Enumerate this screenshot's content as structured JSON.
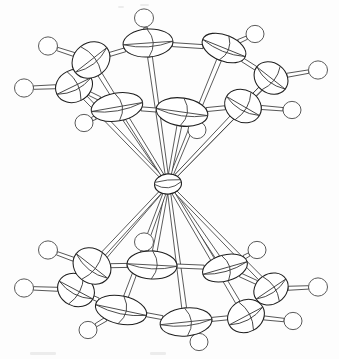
{
  "figure": {
    "kind": "ortep-thermal-ellipsoid-plot",
    "title": "",
    "caption": "",
    "background_color": "#fdfdfd",
    "line_color": "#1f1f1f",
    "hydrogen_line_color": "#5a5a5a",
    "width": 339,
    "height": 359
  },
  "structure": {
    "metal": {
      "label": "M",
      "cx": 168,
      "cy": 184,
      "rx": 13.5,
      "ry": 10.0,
      "rot": -6,
      "octant_style": "double-arc"
    },
    "rings": [
      {
        "name": "upper-ring",
        "carbons": [
          {
            "id": "C1",
            "cx": 148,
            "cy": 43,
            "rx": 25,
            "ry": 14,
            "rot": -4
          },
          {
            "id": "C2",
            "cx": 224,
            "cy": 48,
            "rx": 23,
            "ry": 13,
            "rot": 22
          },
          {
            "id": "C3",
            "cx": 271,
            "cy": 78,
            "rx": 18,
            "ry": 15,
            "rot": 38
          },
          {
            "id": "C4",
            "cx": 243,
            "cy": 106,
            "rx": 19,
            "ry": 16,
            "rot": 30
          },
          {
            "id": "C5",
            "cx": 182,
            "cy": 112,
            "rx": 26,
            "ry": 14,
            "rot": 8
          },
          {
            "id": "C6",
            "cx": 117,
            "cy": 107,
            "rx": 26,
            "ry": 14,
            "rot": -10
          },
          {
            "id": "C7",
            "cx": 74,
            "cy": 86,
            "rx": 19,
            "ry": 16,
            "rot": -26
          },
          {
            "id": "C8",
            "cx": 91,
            "cy": 60,
            "rx": 20,
            "ry": 17,
            "rot": -38
          }
        ],
        "hydrogens": [
          {
            "id": "H1",
            "cx": 144,
            "cy": 18,
            "r": 9.5,
            "bond_to": "C1"
          },
          {
            "id": "H2",
            "cx": 255,
            "cy": 34,
            "r": 9.0,
            "bond_to": "C2"
          },
          {
            "id": "H3",
            "cx": 318,
            "cy": 70,
            "r": 9.5,
            "bond_to": "C3"
          },
          {
            "id": "H4",
            "cx": 292,
            "cy": 110,
            "r": 9.0,
            "bond_to": "C4"
          },
          {
            "id": "H5",
            "cx": 197,
            "cy": 130,
            "r": 9.0,
            "bond_to": "C5"
          },
          {
            "id": "H6",
            "cx": 84,
            "cy": 123,
            "r": 9.0,
            "bond_to": "C6"
          },
          {
            "id": "H7",
            "cx": 24,
            "cy": 88,
            "r": 9.5,
            "bond_to": "C7"
          },
          {
            "id": "H8",
            "cx": 48,
            "cy": 46,
            "r": 9.5,
            "bond_to": "C8"
          }
        ],
        "ring_bonds": [
          [
            "C1",
            "C2"
          ],
          [
            "C2",
            "C3"
          ],
          [
            "C3",
            "C4"
          ],
          [
            "C4",
            "C5"
          ],
          [
            "C5",
            "C6"
          ],
          [
            "C6",
            "C7"
          ],
          [
            "C7",
            "C8"
          ],
          [
            "C8",
            "C1"
          ]
        ],
        "metal_bonds": [
          "C1",
          "C2",
          "C3",
          "C4",
          "C5",
          "C6",
          "C7",
          "C8"
        ]
      },
      {
        "name": "lower-ring",
        "carbons": [
          {
            "id": "C11",
            "cx": 152,
            "cy": 265,
            "rx": 25,
            "ry": 14,
            "rot": 3
          },
          {
            "id": "C12",
            "cx": 225,
            "cy": 268,
            "rx": 23,
            "ry": 13,
            "rot": -16
          },
          {
            "id": "C13",
            "cx": 271,
            "cy": 289,
            "rx": 18,
            "ry": 15,
            "rot": -34
          },
          {
            "id": "C14",
            "cx": 246,
            "cy": 316,
            "rx": 19,
            "ry": 16,
            "rot": -28
          },
          {
            "id": "C15",
            "cx": 186,
            "cy": 322,
            "rx": 26,
            "ry": 14,
            "rot": -6
          },
          {
            "id": "C16",
            "cx": 121,
            "cy": 310,
            "rx": 26,
            "ry": 14,
            "rot": 12
          },
          {
            "id": "C17",
            "cx": 76,
            "cy": 290,
            "rx": 19,
            "ry": 16,
            "rot": 28
          },
          {
            "id": "C18",
            "cx": 92,
            "cy": 266,
            "rx": 20,
            "ry": 17,
            "rot": 38
          }
        ],
        "hydrogens": [
          {
            "id": "H11",
            "cx": 144,
            "cy": 242,
            "r": 9.5,
            "bond_to": "C11"
          },
          {
            "id": "H12",
            "cx": 257,
            "cy": 250,
            "r": 9.0,
            "bond_to": "C12"
          },
          {
            "id": "H13",
            "cx": 318,
            "cy": 287,
            "r": 9.5,
            "bond_to": "C13"
          },
          {
            "id": "H14",
            "cx": 293,
            "cy": 321,
            "r": 9.0,
            "bond_to": "C14"
          },
          {
            "id": "H15",
            "cx": 199,
            "cy": 342,
            "r": 9.0,
            "bond_to": "C15"
          },
          {
            "id": "H16",
            "cx": 88,
            "cy": 330,
            "r": 9.0,
            "bond_to": "C16"
          },
          {
            "id": "H17",
            "cx": 24,
            "cy": 288,
            "r": 9.5,
            "bond_to": "C17"
          },
          {
            "id": "H18",
            "cx": 48,
            "cy": 250,
            "r": 9.5,
            "bond_to": "C18"
          }
        ],
        "ring_bonds": [
          [
            "C11",
            "C12"
          ],
          [
            "C12",
            "C13"
          ],
          [
            "C13",
            "C14"
          ],
          [
            "C14",
            "C15"
          ],
          [
            "C15",
            "C16"
          ],
          [
            "C16",
            "C17"
          ],
          [
            "C17",
            "C18"
          ],
          [
            "C18",
            "C11"
          ]
        ],
        "metal_bonds": [
          "C11",
          "C12",
          "C13",
          "C14",
          "C15",
          "C16",
          "C17",
          "C18"
        ]
      }
    ]
  }
}
